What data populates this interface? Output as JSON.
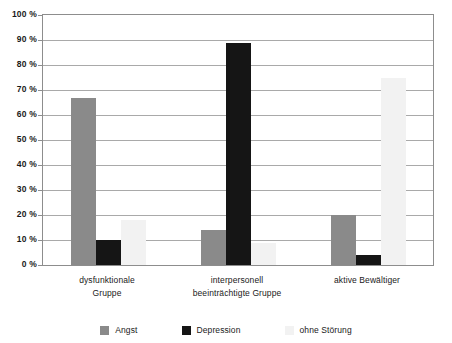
{
  "chart_data": {
    "type": "bar",
    "title": "",
    "subtitle": "",
    "xlabel": "",
    "ylabel": "",
    "ylim": [
      0,
      100
    ],
    "y_tick_labels": [
      "100 %",
      "90 %",
      "80 %",
      "70 %",
      "60 %",
      "50 %",
      "40 %",
      "30 %",
      "20 %",
      "10 %",
      "0 %"
    ],
    "y_tick_values": [
      100,
      90,
      80,
      70,
      60,
      50,
      40,
      30,
      20,
      10,
      0
    ],
    "grid": true,
    "legend_position": "bottom",
    "categories": [
      "dysfunktionale Gruppe",
      "interpersonell beeinträchtigte Gruppe",
      "aktive Bewältiger"
    ],
    "category_lines": [
      [
        "dysfunktionale",
        "Gruppe"
      ],
      [
        "interpersonell",
        "beeinträchtigte Gruppe"
      ],
      [
        "aktive Bewältiger"
      ]
    ],
    "series": [
      {
        "name": "Angst",
        "color": "#8a8a8a",
        "values": [
          67,
          14,
          20
        ]
      },
      {
        "name": "Depression",
        "color": "#151515",
        "values": [
          10,
          89,
          4
        ]
      },
      {
        "name": "ohne Störung",
        "color": "#f2f2f2",
        "values": [
          18,
          9,
          75
        ]
      }
    ]
  },
  "legend": {
    "items": [
      {
        "label": "Angst",
        "color": "#8a8a8a"
      },
      {
        "label": "Depression",
        "color": "#151515"
      },
      {
        "label": "ohne Störung",
        "color": "#f2f2f2"
      }
    ]
  },
  "colors": {
    "axis": "#8d8d8d",
    "grid": "#a9a9a9",
    "text": "#1a1a1a",
    "background": "#ffffff"
  }
}
